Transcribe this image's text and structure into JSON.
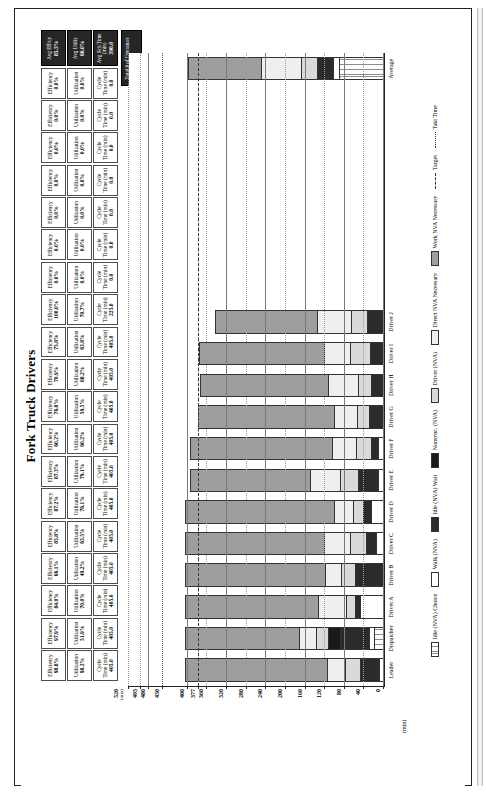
{
  "chart_data": {
    "type": "bar",
    "title": "Fork Truck Drivers",
    "xlabel": "",
    "ylabel": "",
    "ylim": [
      0,
      520
    ],
    "grid": true,
    "legend_position": "bottom",
    "axis_unit": "(min)",
    "yticks": [
      "520",
      "495",
      "480",
      "450",
      "400",
      "377",
      "360",
      "320",
      "280",
      "240",
      "200",
      "160",
      "120",
      "80",
      "40",
      "0"
    ],
    "reference_lines": [
      {
        "name": "Target",
        "value": 377,
        "style": "dashed"
      },
      {
        "name": "Takt Time",
        "value": 450,
        "style": "dotted"
      }
    ],
    "categories": [
      "Leader",
      "Dispatcher",
      "Driver A",
      "Driver B",
      "Driver C",
      "Driver D",
      "Driver E",
      "Driver F",
      "Driver G",
      "Driver H",
      "Driver I",
      "Driver J",
      "",
      "",
      "",
      "",
      "",
      "",
      "",
      "Average"
    ],
    "series": [
      {
        "name": "Idle (NVA) Choice",
        "key": "idlechoice",
        "values": [
          0,
          17,
          0,
          0,
          0,
          0,
          0,
          0,
          0,
          0,
          0,
          0,
          0,
          0,
          0,
          0,
          0,
          0,
          0,
          88
        ]
      },
      {
        "name": "Walk (NVA)",
        "key": "walk",
        "values": [
          6,
          9,
          45,
          0,
          13,
          22,
          9,
          8,
          0,
          0,
          0,
          0,
          0,
          0,
          0,
          0,
          0,
          0,
          0,
          13
        ]
      },
      {
        "name": "Idle (NVA) Wait",
        "key": "idlewait",
        "values": [
          40,
          60,
          10,
          55,
          20,
          18,
          40,
          15,
          27,
          22,
          25,
          30,
          0,
          0,
          0,
          0,
          0,
          0,
          0,
          34
        ]
      },
      {
        "name": "Nonsync. (NVA)",
        "key": "nonsync",
        "values": [
          0,
          25,
          0,
          0,
          0,
          0,
          0,
          0,
          0,
          0,
          0,
          0,
          0,
          0,
          0,
          0,
          0,
          0,
          0,
          0
        ]
      },
      {
        "name": "Driver (NVA)",
        "key": "driver",
        "values": [
          30,
          26,
          20,
          30,
          32,
          20,
          38,
          30,
          25,
          27,
          40,
          35,
          0,
          0,
          0,
          0,
          0,
          0,
          0,
          31
        ]
      },
      {
        "name": "Direct NVA Necessary",
        "key": "directnva",
        "values": [
          38,
          35,
          57,
          32,
          54,
          38,
          62,
          51,
          48,
          62,
          55,
          70,
          0,
          0,
          0,
          0,
          0,
          0,
          0,
          84
        ]
      },
      {
        "name": "Work NVA Necessary",
        "key": "worknva",
        "values": [
          291,
          233,
          273,
          288,
          286,
          307,
          246,
          291,
          280,
          264,
          258,
          210,
          0,
          0,
          0,
          0,
          0,
          0,
          0,
          150
        ]
      }
    ]
  },
  "metrics_table": {
    "row_labels": [
      "Efficiency",
      "Utilization",
      "Cycle Time (min)"
    ],
    "columns": [
      {
        "efficiency_label": "Efficiency",
        "efficiency": "98.8%",
        "utilization_label": "Utilization",
        "utilization": "98.2%",
        "cycle_label": "Cycle\nTime (min)",
        "cycle": "405.0"
      },
      {
        "efficiency_label": "Efficiency",
        "efficiency": "97.9%",
        "utilization_label": "Utilization",
        "utilization": "51.9%",
        "cycle_label": "Cycle\nTime (min)",
        "cycle": "405.0"
      },
      {
        "efficiency_label": "Efficiency",
        "efficiency": "84.0%",
        "utilization_label": "Utilization",
        "utilization": "70.0%",
        "cycle_label": "Cycle\nTime (min)",
        "cycle": "405.0"
      },
      {
        "efficiency_label": "Efficiency",
        "efficiency": "66.1%",
        "utilization_label": "Utilization",
        "utilization": "49.2%",
        "cycle_label": "Cycle\nTime (min)",
        "cycle": "405.0"
      },
      {
        "efficiency_label": "Efficiency",
        "efficiency": "85.8%",
        "utilization_label": "Utilization",
        "utilization": "63.5%",
        "cycle_label": "Cycle\nTime (min)",
        "cycle": "405.0"
      },
      {
        "efficiency_label": "Efficiency",
        "efficiency": "87.2%",
        "utilization_label": "Utilization",
        "utilization": "76.1%",
        "cycle_label": "Cycle\nTime (min)",
        "cycle": "405.0"
      },
      {
        "efficiency_label": "Efficiency",
        "efficiency": "87.3%",
        "utilization_label": "Utilization",
        "utilization": "79.1%",
        "cycle_label": "Cycle\nTime (min)",
        "cycle": "405.0"
      },
      {
        "efficiency_label": "Efficiency",
        "efficiency": "60.2%",
        "utilization_label": "Utilization",
        "utilization": "60.2%",
        "cycle_label": "Cycle\nTime (min)",
        "cycle": "405.0"
      },
      {
        "efficiency_label": "Efficiency",
        "efficiency": "76.8%",
        "utilization_label": "Utilization",
        "utilization": "59.5%",
        "cycle_label": "Cycle\nTime (min)",
        "cycle": "405.0"
      },
      {
        "efficiency_label": "Efficiency",
        "efficiency": "70.9%",
        "utilization_label": "Utilization",
        "utilization": "68.2%",
        "cycle_label": "Cycle\nTime (min)",
        "cycle": "405.0"
      },
      {
        "efficiency_label": "Efficiency",
        "efficiency": "75.8%",
        "utilization_label": "Utilization",
        "utilization": "63.8%",
        "cycle_label": "Cycle\nTime (min)",
        "cycle": "405.0"
      },
      {
        "efficiency_label": "Efficiency",
        "efficiency": "100.0%",
        "utilization_label": "Utilization",
        "utilization": "70.7%",
        "cycle_label": "Cycle\nTime (min)",
        "cycle": "225.0"
      },
      {
        "efficiency_label": "Efficiency",
        "efficiency": "0.0%",
        "utilization_label": "Utilization",
        "utilization": "0.0%",
        "cycle_label": "Cycle\nTime (min)",
        "cycle": "0.0"
      },
      {
        "efficiency_label": "Efficiency",
        "efficiency": "0.0%",
        "utilization_label": "Utilization",
        "utilization": "0.0%",
        "cycle_label": "Cycle\nTime (min)",
        "cycle": "0.0"
      },
      {
        "efficiency_label": "Efficiency",
        "efficiency": "0.0%",
        "utilization_label": "Utilization",
        "utilization": "0.0%",
        "cycle_label": "Cycle\nTime (min)",
        "cycle": "0.0"
      },
      {
        "efficiency_label": "Efficiency",
        "efficiency": "0.0%",
        "utilization_label": "Utilization",
        "utilization": "0.0%",
        "cycle_label": "Cycle\nTime (min)",
        "cycle": "0.0"
      },
      {
        "efficiency_label": "Efficiency",
        "efficiency": "0.0%",
        "utilization_label": "Utilization",
        "utilization": "0.0%",
        "cycle_label": "Cycle\nTime (min)",
        "cycle": "0.0"
      },
      {
        "efficiency_label": "Efficiency",
        "efficiency": "0.0%",
        "utilization_label": "Utilization",
        "utilization": "0.0%",
        "cycle_label": "Cycle\nTime (min)",
        "cycle": "0.0"
      },
      {
        "efficiency_label": "Efficiency",
        "efficiency": "0.0%",
        "utilization_label": "Utilization",
        "utilization": "0.0%",
        "cycle_label": "Cycle\nTime (min)",
        "cycle": "0.0"
      }
    ],
    "summary": {
      "avg_eff_label": "Avg Eff/cy",
      "avg_eff": "85.5%",
      "avg_util_label": "Avg Utiliz",
      "avg_util": "66.0%",
      "avg_cycle_label": "Avg Sch Time (min)",
      "avg_cycle": "390.0",
      "operators_label": "Total # of Operators",
      "operators": "12"
    }
  }
}
